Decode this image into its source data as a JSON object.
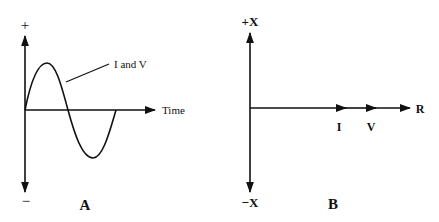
{
  "diagram_a": {
    "panel_label": "A",
    "y_axis_top_label": "+",
    "y_axis_bottom_label": "−",
    "x_axis_label": "Time",
    "curve_label": "I and V"
  },
  "diagram_b": {
    "panel_label": "B",
    "y_axis_top_label": "+X",
    "y_axis_bottom_label": "−X",
    "x_axis_label": "R",
    "vector_labels": [
      "I",
      "V"
    ]
  },
  "colors": {
    "ink": "#111111",
    "background": "#ffffff"
  }
}
